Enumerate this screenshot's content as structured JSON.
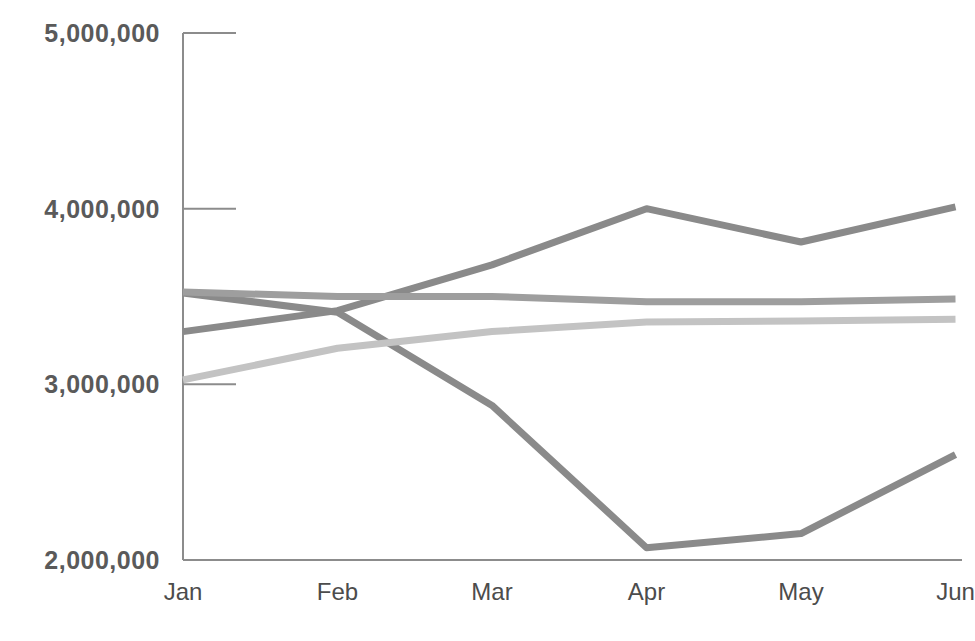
{
  "chart_data": {
    "type": "line",
    "title": "",
    "subtitle": "",
    "xlabel": "",
    "ylabel": "",
    "categories": [
      "Jan",
      "Feb",
      "Mar",
      "Apr",
      "May",
      "Jun"
    ],
    "ytick_labels": [
      "5,000,000",
      "4,000,000",
      "3,000,000",
      "2,000,000"
    ],
    "ytick_values": [
      5000000,
      4000000,
      3000000,
      2000000
    ],
    "ylim": [
      2000000,
      5000000
    ],
    "grid": false,
    "legend": "none",
    "note": "Rightmost category 'Jun' label is clipped by the right edge of the image.",
    "series": [
      {
        "name": "series-1-rising",
        "color": "#8a8a8a",
        "values": [
          3300000,
          3420000,
          3680000,
          4000000,
          3810000,
          4010000
        ]
      },
      {
        "name": "series-2-declining",
        "color": "#8a8a8a",
        "values": [
          3520000,
          3410000,
          2880000,
          2070000,
          2150000,
          2600000
        ]
      },
      {
        "name": "series-3-flat-mid",
        "color": "#9e9e9e",
        "values": [
          3525000,
          3500000,
          3500000,
          3470000,
          3470000,
          3485000
        ]
      },
      {
        "name": "series-4-flat-low",
        "color": "#c3c3c3",
        "values": [
          3025000,
          3205000,
          3300000,
          3355000,
          3360000,
          3370000
        ]
      }
    ],
    "colors": {
      "axis": "#8c8c8c",
      "ytick_text": "#5a5a5a",
      "xtick_text": "#4c4c4c",
      "background": "#ffffff"
    }
  }
}
